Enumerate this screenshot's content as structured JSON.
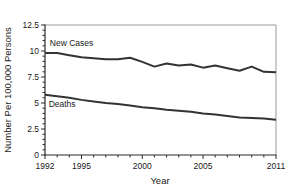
{
  "figure": {
    "background": "#ffffff"
  },
  "chart_data": {
    "type": "line",
    "title": "",
    "xlabel": "Year",
    "ylabel": "Number Per 100,000 Persons",
    "x": [
      1992,
      1993,
      1994,
      1995,
      1996,
      1997,
      1998,
      1999,
      2000,
      2001,
      2002,
      2003,
      2004,
      2005,
      2006,
      2007,
      2008,
      2009,
      2010,
      2011
    ],
    "series": [
      {
        "name": "New Cases",
        "color": "#333333",
        "values": [
          9.8,
          9.8,
          9.6,
          9.4,
          9.3,
          9.2,
          9.2,
          9.35,
          8.95,
          8.5,
          8.8,
          8.6,
          8.7,
          8.4,
          8.6,
          8.35,
          8.1,
          8.5,
          8.0,
          7.95
        ]
      },
      {
        "name": "Deaths",
        "color": "#333333",
        "values": [
          5.8,
          5.65,
          5.5,
          5.3,
          5.15,
          5.0,
          4.9,
          4.75,
          4.6,
          4.5,
          4.35,
          4.25,
          4.15,
          4.0,
          3.9,
          3.75,
          3.6,
          3.55,
          3.5,
          3.4
        ]
      }
    ],
    "xlim": [
      1992,
      2011
    ],
    "ylim": [
      0,
      12.5
    ],
    "yticks": [
      0,
      2.5,
      5,
      7.5,
      10,
      12.5
    ],
    "ytick_labels": [
      "0",
      "2.5",
      "5",
      "7.5",
      "10",
      "12.5"
    ],
    "y_minor_step": 0.5,
    "xticks_labeled": [
      1992,
      1995,
      2000,
      2005,
      2011
    ],
    "xtick_labels": [
      "1992",
      "1995",
      "2000",
      "2005",
      "2011"
    ],
    "x_minor_step": 1,
    "grid": false,
    "legend_position": "inline-annotations",
    "annotations": [
      {
        "text": "New Cases",
        "x": 1992.4,
        "y": 10.75,
        "anchor": "start"
      },
      {
        "text": "Deaths",
        "x": 1992.3,
        "y": 4.95,
        "anchor": "start"
      }
    ],
    "axis_color": "#2b2b2b",
    "box_color": "#9a9a9a",
    "text_color": "#1a1a1a"
  }
}
